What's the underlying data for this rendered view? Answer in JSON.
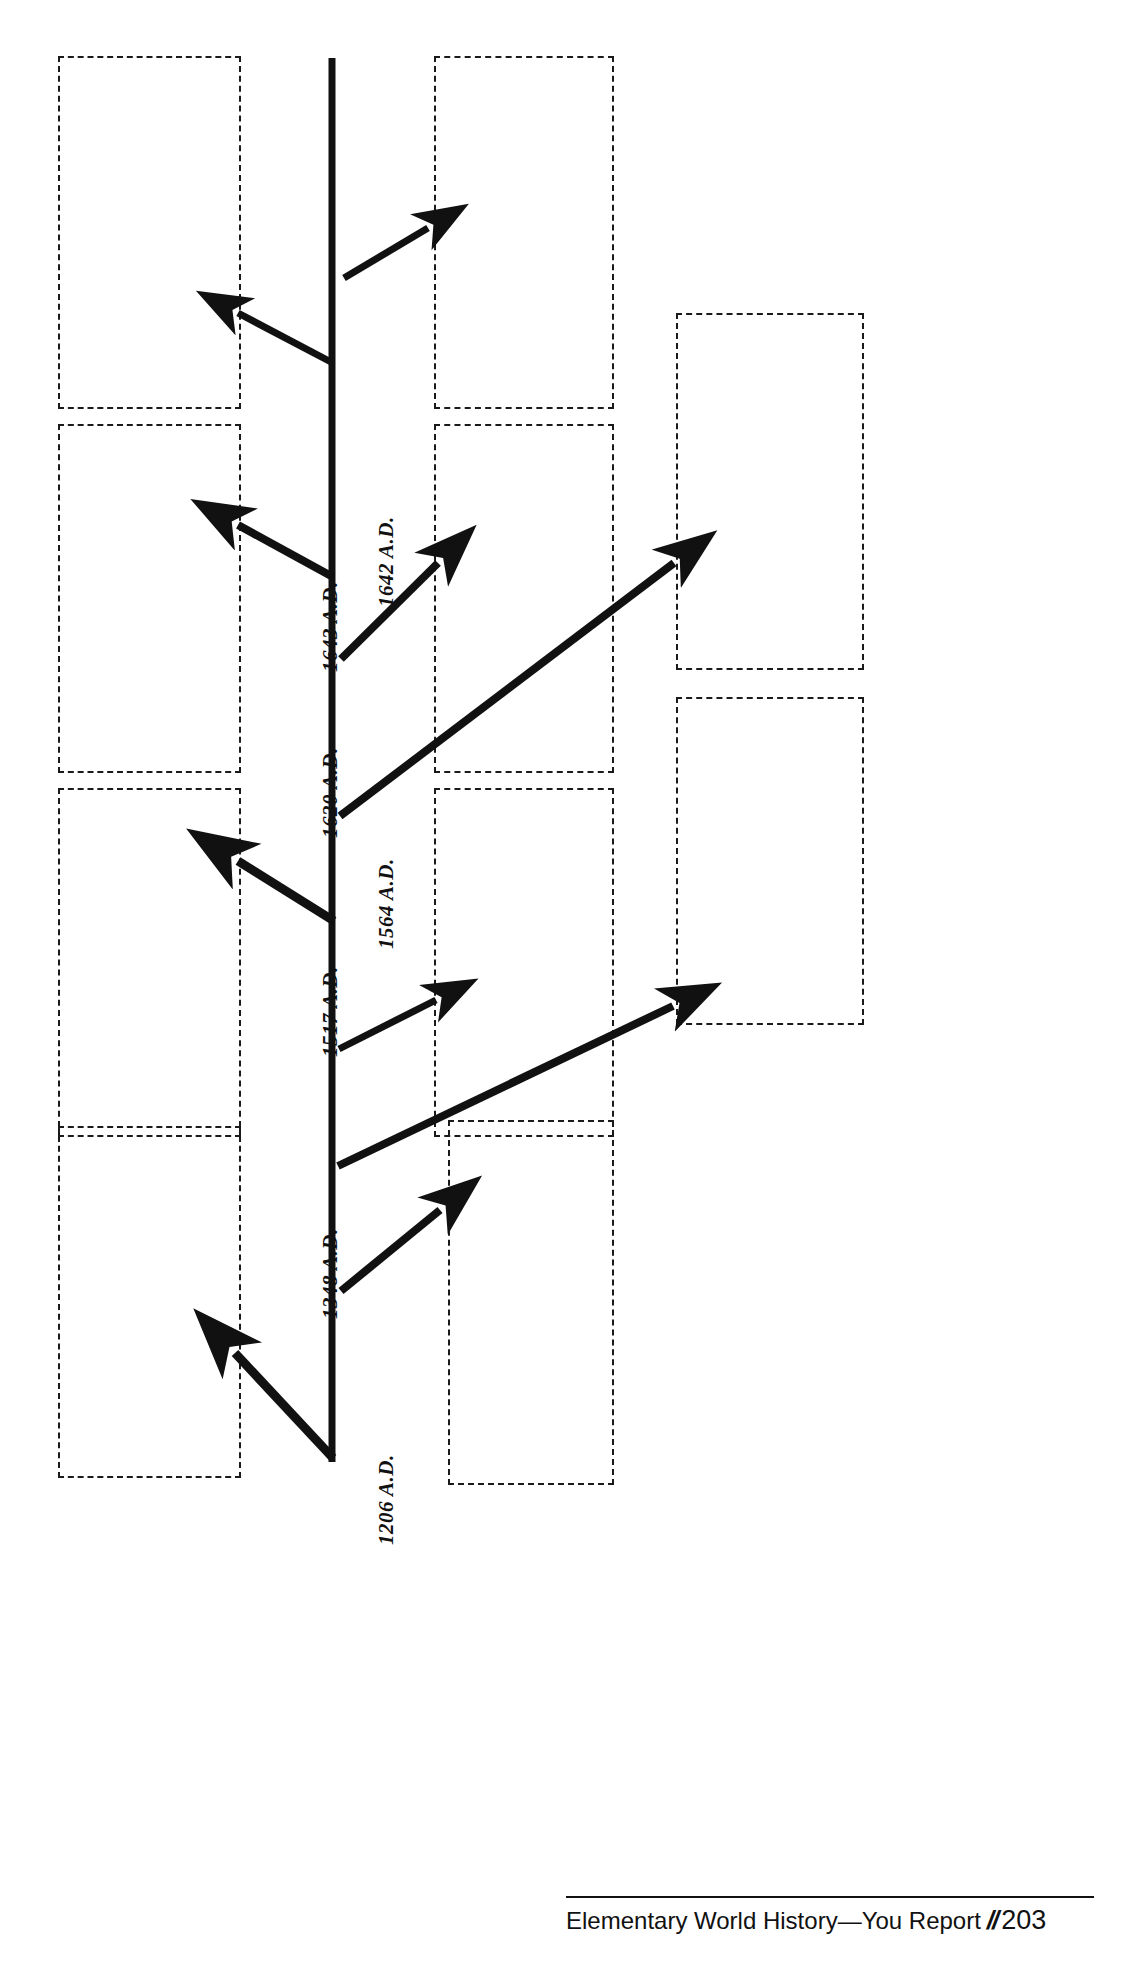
{
  "page": {
    "orientation": "rotated-90",
    "page_number": "203",
    "book_title": "Elementary World History—You Report",
    "footer_separator": "//"
  },
  "timeline": {
    "axis_label": "timeline-axis",
    "events": [
      {
        "id": "e1206",
        "label": "1206 A.D.",
        "side": "left",
        "arrow_to": "box-left-1"
      },
      {
        "id": "e1348",
        "label": "1348 A.D.",
        "side": "left",
        "arrow_to": "box-right-1"
      },
      {
        "id": "e1450",
        "label": "",
        "side": "right",
        "arrow_to": "box-far-right-1"
      },
      {
        "id": "e1517",
        "label": "1517 A.D.",
        "side": "left",
        "arrow_to": "box-right-2"
      },
      {
        "id": "e1564",
        "label": "1564 A.D.",
        "side": "right",
        "arrow_to": "box-left-2"
      },
      {
        "id": "e1620",
        "label": "1620 A.D.",
        "side": "right",
        "arrow_to": "box-far-right-2"
      },
      {
        "id": "e1643",
        "label": "1643 A.D.",
        "side": "left",
        "arrow_to": "box-left-3"
      },
      {
        "id": "e1642",
        "label": "1642 A.D.",
        "side": "right",
        "arrow_to": "box-right-3"
      },
      {
        "id": "eTop1",
        "label": "",
        "side": "right",
        "arrow_to": "box-right-4"
      },
      {
        "id": "eTop2",
        "label": "",
        "side": "left",
        "arrow_to": "box-left-4"
      }
    ]
  },
  "answer_boxes": [
    {
      "id": "box-left-4",
      "label": "answer-box"
    },
    {
      "id": "box-right-4",
      "label": "answer-box"
    },
    {
      "id": "box-left-3",
      "label": "answer-box"
    },
    {
      "id": "box-right-3",
      "label": "answer-box"
    },
    {
      "id": "box-far-right-1",
      "label": "answer-box"
    },
    {
      "id": "box-left-2",
      "label": "answer-box"
    },
    {
      "id": "box-far-right-2",
      "label": "answer-box"
    },
    {
      "id": "box-right-2",
      "label": "answer-box"
    },
    {
      "id": "box-left-1",
      "label": "answer-box"
    },
    {
      "id": "box-right-1",
      "label": "answer-box"
    }
  ],
  "labels": {
    "d1206": "1206 A.D.",
    "d1348": "1348 A.D.",
    "d1517": "1517 A.D.",
    "d1564": "1564 A.D.",
    "d1620": "1620 A.D.",
    "d1642": "1642 A.D.",
    "d1643": "1643 A.D."
  },
  "footer": {
    "book": "Elementary World History—You Report",
    "marks": "//",
    "page": "203"
  }
}
